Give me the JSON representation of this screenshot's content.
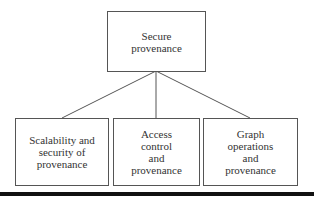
{
  "diagram": {
    "root": {
      "label": "Secure\nprovenance"
    },
    "children": [
      {
        "label": "Scalability and\nsecurity of\nprovenance"
      },
      {
        "label": "Access\ncontrol\nand\nprovenance"
      },
      {
        "label": "Graph\noperations\nand\nprovenance"
      }
    ],
    "edges": [
      {
        "from": "root",
        "to": "child-0"
      },
      {
        "from": "root",
        "to": "child-1"
      },
      {
        "from": "root",
        "to": "child-2"
      }
    ]
  }
}
